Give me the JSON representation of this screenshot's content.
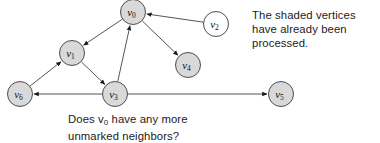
{
  "figure": {
    "background": "#ffffff",
    "width": 380,
    "height": 143
  },
  "styles": {
    "shaded_fill": "#d9d9d9",
    "unshaded_fill": "#ffffff",
    "node_stroke": "#4d4d4d",
    "edge_stroke": "#555555",
    "text_color": "#1b1b1b"
  },
  "graph": {
    "node_radius": 12.5,
    "nodes": [
      {
        "id": "v0",
        "label": "v",
        "sub": "0",
        "cx": 133,
        "cy": 12,
        "shaded": true
      },
      {
        "id": "v1",
        "label": "v",
        "sub": "1",
        "cx": 72,
        "cy": 53,
        "shaded": true
      },
      {
        "id": "v2",
        "label": "v",
        "sub": "2",
        "cx": 216,
        "cy": 24,
        "shaded": false
      },
      {
        "id": "v3",
        "label": "v",
        "sub": "3",
        "cx": 115,
        "cy": 94,
        "shaded": true
      },
      {
        "id": "v4",
        "label": "v",
        "sub": "4",
        "cx": 188,
        "cy": 65,
        "shaded": true
      },
      {
        "id": "v5",
        "label": "v",
        "sub": "5",
        "cx": 281,
        "cy": 94,
        "shaded": true
      },
      {
        "id": "v6",
        "label": "v",
        "sub": "6",
        "cx": 20,
        "cy": 94,
        "shaded": true
      }
    ],
    "edges": [
      {
        "id": "e-v0-v1",
        "from": "v0",
        "to": "v1",
        "directed": true
      },
      {
        "id": "e-v3-v0",
        "from": "v3",
        "to": "v0",
        "directed": true
      },
      {
        "id": "e-v2-v0",
        "from": "v2",
        "to": "v0",
        "directed": true
      },
      {
        "id": "e-v0-v4",
        "from": "v0",
        "to": "v4",
        "directed": true
      },
      {
        "id": "e-v1-v3",
        "from": "v1",
        "to": "v3",
        "directed": true
      },
      {
        "id": "e-v6-v1",
        "from": "v6",
        "to": "v1",
        "directed": true
      },
      {
        "id": "e-v3-v6",
        "from": "v3",
        "to": "v6",
        "directed": true
      },
      {
        "id": "e-v3-v5",
        "from": "v3",
        "to": "v5",
        "directed": true
      }
    ]
  },
  "note": {
    "lines": [
      "The shaded vertices",
      "have already been",
      "processed."
    ]
  },
  "caption": {
    "line1_before": "Does v",
    "line1_sub": "0",
    "line1_after": " have any more",
    "line2": "unmarked neighbors?"
  }
}
